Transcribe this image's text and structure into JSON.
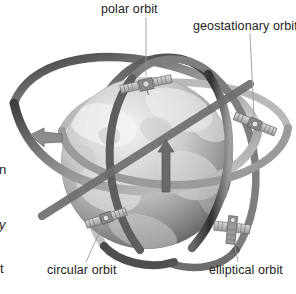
{
  "figure": {
    "kind": "satellite-orbits-diagram",
    "palette": {
      "background": "#ffffff",
      "text": "#1c1c1c",
      "leader_line": "#8a8a8a",
      "ribbon_dark": "#4a4a4a",
      "ribbon_mid": "#6f6f6f",
      "ribbon_light": "#b8b8b8",
      "globe_light": "#e9e9e9",
      "globe_mid": "#9d9d9d",
      "globe_dark": "#555555",
      "satellite_body": "#8e8e8e",
      "satellite_panel": "#c9c9c9"
    }
  },
  "labels": [
    {
      "id": "polar",
      "text": "polar orbit",
      "clipped": false
    },
    {
      "id": "geostationary",
      "text": "geostationary orbit",
      "clipped": true
    },
    {
      "id": "circular",
      "text": "circular orbit",
      "clipped": false
    },
    {
      "id": "elliptical",
      "text": "elliptical orbit",
      "clipped": false
    }
  ],
  "edge_fragments": [
    {
      "id": "frag-n",
      "text": "n"
    },
    {
      "id": "frag-y",
      "text": "y"
    },
    {
      "id": "frag-t",
      "text": "t"
    }
  ],
  "satellites": [
    {
      "id": "sat-polar",
      "name": "polar-orbit-satellite"
    },
    {
      "id": "sat-geostationary",
      "name": "geostationary-orbit-satellite"
    },
    {
      "id": "sat-circular",
      "name": "circular-orbit-satellite"
    },
    {
      "id": "sat-elliptical",
      "name": "elliptical-orbit-satellite"
    }
  ],
  "orbits": [
    {
      "id": "orbit-polar",
      "name": "polar-orbit-band"
    },
    {
      "id": "orbit-geostationary",
      "name": "geostationary-orbit-band"
    },
    {
      "id": "orbit-circular",
      "name": "circular-orbit-band"
    },
    {
      "id": "orbit-elliptical",
      "name": "elliptical-orbit-band"
    }
  ],
  "arrows": [
    {
      "id": "arrow-left",
      "name": "orbit-direction-arrow-left",
      "direction": "right"
    },
    {
      "id": "arrow-center",
      "name": "orbit-direction-arrow-center",
      "direction": "up"
    }
  ]
}
